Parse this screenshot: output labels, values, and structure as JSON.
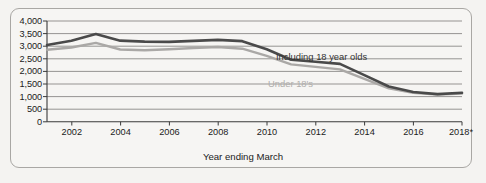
{
  "chart_data": {
    "type": "line",
    "title": "",
    "xlabel": "Year ending March",
    "ylabel": "",
    "xlim": [
      2001,
      2018
    ],
    "ylim": [
      0,
      4000
    ],
    "grid": true,
    "legend_position": "inline-annotations",
    "x": [
      2001,
      2002,
      2003,
      2004,
      2005,
      2006,
      2007,
      2008,
      2009,
      2010,
      2011,
      2012,
      2013,
      2014,
      2015,
      2016,
      2017,
      2018
    ],
    "x_tick_labels": [
      "2002",
      "2004",
      "2006",
      "2008",
      "2010",
      "2012",
      "2014",
      "2016",
      "2018*"
    ],
    "x_tick_values": [
      2002,
      2004,
      2006,
      2008,
      2010,
      2012,
      2014,
      2016,
      2018
    ],
    "y_tick_labels": [
      "0",
      "500",
      "1,000",
      "1,500",
      "2,000",
      "2,500",
      "3,000",
      "3,500",
      "4,000"
    ],
    "y_tick_values": [
      0,
      500,
      1000,
      1500,
      2000,
      2500,
      3000,
      3500,
      4000
    ],
    "series": [
      {
        "name": "Including 18 year olds",
        "color": "#4a4a4a",
        "values": [
          3050,
          3220,
          3480,
          3220,
          3180,
          3170,
          3210,
          3250,
          3200,
          2880,
          2460,
          2380,
          2300,
          1850,
          1400,
          1180,
          1100,
          1150
        ]
      },
      {
        "name": "Under 18's",
        "color": "#aaa8a6",
        "values": [
          2860,
          2950,
          3130,
          2870,
          2840,
          2880,
          2930,
          2970,
          2900,
          2620,
          2280,
          2180,
          2080,
          1700,
          1330,
          1150,
          1080,
          1120
        ]
      }
    ],
    "annotations": [
      {
        "text": "Including 18 year olds",
        "color": "#343434"
      },
      {
        "text": "Under 18's",
        "color": "#b0aeac"
      }
    ],
    "footnote_marker": "*"
  },
  "axis": {
    "x_title": "Year ending March"
  },
  "colors": {
    "background": "#f4f3f1",
    "frame_border": "#a9a7a4",
    "gridline": "#6d6b69",
    "axis_line": "#3a3a3a",
    "series_dark": "#4a4a4a",
    "series_light": "#aaa8a6"
  }
}
